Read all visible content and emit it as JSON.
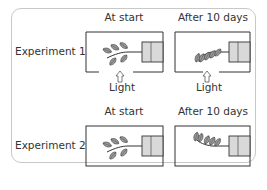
{
  "diagram": {
    "type": "phototropism-experiment",
    "columns": [
      "At start",
      "After 10 days"
    ],
    "experiments": [
      {
        "label": "Experiment 1",
        "light_source": "below",
        "light_label": "Light",
        "panels": [
          {
            "stage": "At start",
            "description": "Horizontal shoot with leaves extending left from a clamp on the right wall; opening in the bottom of the box with light arrow pointing up"
          },
          {
            "stage": "After 10 days",
            "description": "Shoot has bent downward toward the light opening"
          }
        ]
      },
      {
        "label": "Experiment 2",
        "light_source": "none",
        "panels": [
          {
            "stage": "At start",
            "description": "Horizontal shoot in closed box (darkness)"
          },
          {
            "stage": "After 10 days",
            "description": "Shoot has bent upward (negative gravitropism)"
          }
        ]
      }
    ]
  },
  "labels": {
    "exp1_col1": "At start",
    "exp1_col2": "After 10 days",
    "exp1_row": "Experiment 1",
    "light1": "Light",
    "light2": "Light",
    "exp2_col1": "At start",
    "exp2_col2": "After 10 days",
    "exp2_row": "Experiment 2"
  },
  "colors": {
    "frame": "#c8c8c8",
    "box_line": "#333333",
    "clamp_fill": "#d9d9d9",
    "leaf_fill": "#9a9a9a",
    "text": "#333333"
  }
}
